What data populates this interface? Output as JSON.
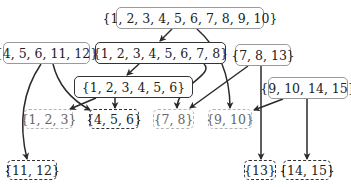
{
  "diagram": {
    "type": "set-hierarchy-dag",
    "nodes": [
      {
        "id": "n1to10",
        "label": "{1, 2, 3, 4, 5, 6, 7, 8, 9, 10}",
        "style": "solid-light"
      },
      {
        "id": "n4_5_6_11_12",
        "label": "{4, 5, 6, 11, 12}",
        "style": "solid-light"
      },
      {
        "id": "n1to8",
        "label": "{1, 2, 3, 4, 5, 6, 7, 8}",
        "style": "solid-dark"
      },
      {
        "id": "n7_8_13",
        "label": "{7, 8, 13}",
        "style": "solid-light"
      },
      {
        "id": "n9_10_14_15",
        "label": "{9, 10, 14, 15}",
        "style": "solid-light"
      },
      {
        "id": "n1to6",
        "label": "{1, 2, 3, 4, 5, 6}",
        "style": "solid-dark"
      },
      {
        "id": "n1_2_3",
        "label": "{1, 2, 3}",
        "style": "dash-light"
      },
      {
        "id": "n4_5_6",
        "label": "{4, 5, 6}",
        "style": "dash-dark"
      },
      {
        "id": "n7_8",
        "label": "{7, 8}",
        "style": "dash-light"
      },
      {
        "id": "n9_10",
        "label": "{9, 10}",
        "style": "dash-light"
      },
      {
        "id": "n11_12",
        "label": "{11, 12}",
        "style": "dash-dark"
      },
      {
        "id": "n13",
        "label": "{13}",
        "style": "dash-dark"
      },
      {
        "id": "n14_15",
        "label": "{14, 15}",
        "style": "dash-dark"
      }
    ],
    "edges": [
      {
        "from": "n1to10",
        "to": "n1to8"
      },
      {
        "from": "n1to10",
        "to": "n9_10"
      },
      {
        "from": "n1to8",
        "to": "n1to6"
      },
      {
        "from": "n1to8",
        "to": "n7_8"
      },
      {
        "from": "n1to6",
        "to": "n1_2_3"
      },
      {
        "from": "n1to6",
        "to": "n4_5_6"
      },
      {
        "from": "n4_5_6_11_12",
        "to": "n4_5_6"
      },
      {
        "from": "n4_5_6_11_12",
        "to": "n11_12"
      },
      {
        "from": "n7_8_13",
        "to": "n7_8"
      },
      {
        "from": "n7_8_13",
        "to": "n13"
      },
      {
        "from": "n9_10_14_15",
        "to": "n9_10"
      },
      {
        "from": "n9_10_14_15",
        "to": "n14_15"
      }
    ],
    "colors": {
      "edge": "#2a2a2a",
      "dark_border": "#333333",
      "light_border": "#9a9a9a",
      "faded_border": "#b5b5b5"
    }
  }
}
